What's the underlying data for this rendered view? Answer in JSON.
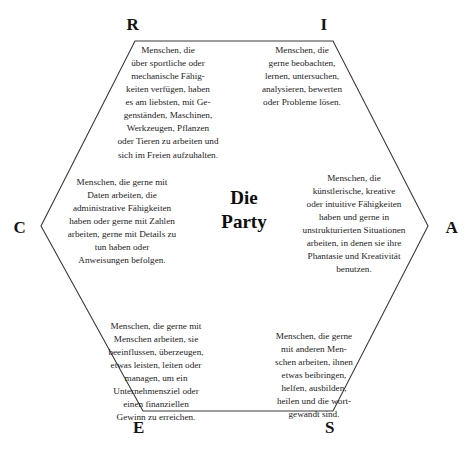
{
  "diagram": {
    "center": {
      "line1": "Die",
      "line2": "Party"
    },
    "corners": {
      "r": "R",
      "i": "I",
      "a": "A",
      "s": "S",
      "e": "E",
      "c": "C"
    },
    "segments": {
      "r": "Menschen, die\nüber sportliche oder\nmechanische Fähig-\nkeiten verfügen, haben\nes am liebsten, mit Ge-\ngenständen, Maschinen,\nWerkzeugen, Pflanzen\noder Tieren zu arbeiten und\nsich im Freien aufzuhalten.",
      "i": "Menschen, die\ngerne beobachten,\nlernen, untersuchen,\nanalysieren, bewerten\noder Probleme lösen.",
      "a": "Menschen, die\nkünstlerische, kreative\noder intuitive Fähigkeiten\nhaben und gerne in\nunstrukturierten Situationen\narbeiten, in denen sie ihre\nPhantasie und Kreativität\nbenutzen.",
      "s": "Menschen, die gerne\nmit anderen Men-\nschen arbeiten, ihnen\netwas beibringen,\nhelfen, ausbilden,\nheilen und die wort-\ngewandt sind.",
      "e": "Menschen, die gerne mit\nMenschen arbeiten, sie\nbeeinflussen, überzeugen,\netwas leisten, leiten oder\nmanagen, um ein\nUnternehmensziel oder\neinen finanziellen\nGewinn zu erreichen.",
      "c": "Menschen, die gerne mit\nDaten arbeiten, die\nadministrative Fähigkeiten\nhaben oder gerne mit Zahlen\narbeiten, gerne mit Details zu\ntun haben oder\nAnweisungen befolgen."
    },
    "style": {
      "outline_color": "#3a3a3a",
      "text_color": "#1c1c1c",
      "background": "#ffffff"
    }
  }
}
